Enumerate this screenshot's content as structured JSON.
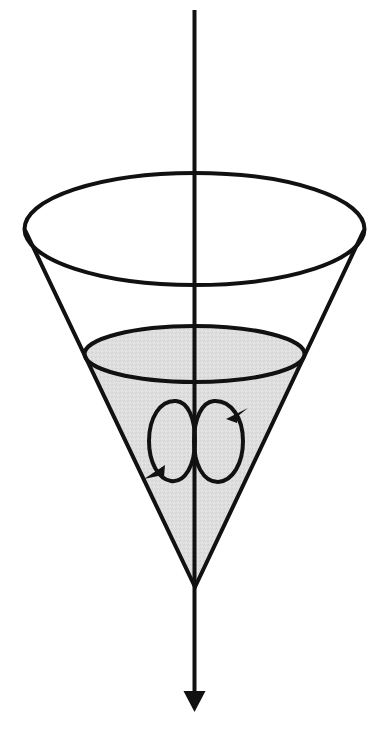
{
  "figure": {
    "canvas": {
      "width": 383,
      "height": 738,
      "background": "#ffffff"
    },
    "colors": {
      "stroke": "#111111",
      "shade_fill": "#dcdcdc",
      "shade_fill_light": "#e4e4e4",
      "background": "#ffffff"
    },
    "elements": {
      "rotation_axis": {
        "name": "rotation-axis",
        "x": 194.5,
        "y_top": 10,
        "y_bottom": 712,
        "stroke_width": 4,
        "arrow": {
          "tip_y": 712,
          "base_y": 691,
          "half_width": 11
        }
      },
      "cone_rim_ellipse": {
        "name": "cone-rim-ellipse",
        "cx": 194.5,
        "cy": 229,
        "rx": 170,
        "ry": 56,
        "stroke_width": 4
      },
      "cone_left_side": {
        "name": "cone-left-side",
        "x1": 25,
        "y1": 230,
        "x2": 195,
        "y2": 587,
        "stroke_width": 4
      },
      "cone_right_side": {
        "name": "cone-right-side",
        "x1": 366,
        "y1": 230,
        "x2": 195,
        "y2": 587,
        "stroke_width": 4
      },
      "fluid_surface_ellipse": {
        "name": "fluid-surface-ellipse",
        "cx": 194.5,
        "cy": 354,
        "rx": 110,
        "ry": 28,
        "stroke_width": 4
      },
      "fluid_body": {
        "name": "fluid-body-shaded-region",
        "apex_x": 195,
        "apex_y": 587,
        "fill": "#dcdcdc"
      },
      "swirl_loop_left": {
        "name": "swirl-loop-left",
        "cx": 172,
        "cy": 441,
        "rx": 23,
        "ry": 41,
        "stroke_width": 4,
        "arrow_position": "bottom-left",
        "direction": "counter-clockwise"
      },
      "swirl_loop_right": {
        "name": "swirl-loop-right",
        "cx": 218,
        "cy": 441,
        "rx": 25,
        "ry": 41,
        "stroke_width": 4,
        "arrow_position": "top-right",
        "direction": "clockwise"
      }
    },
    "labels": []
  }
}
